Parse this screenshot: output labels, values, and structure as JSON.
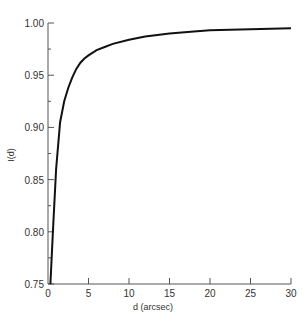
{
  "chart_data": {
    "type": "line",
    "title": "",
    "xlabel": "d (arcsec)",
    "ylabel": "I(d)",
    "xlim": [
      0,
      30
    ],
    "ylim": [
      0.75,
      1.0
    ],
    "grid": false,
    "legend": null,
    "x_ticks": [
      "0",
      "5",
      "10",
      "15",
      "20",
      "25",
      "30"
    ],
    "y_ticks": [
      "0.75",
      "0.80",
      "0.85",
      "0.90",
      "0.95",
      "1.00"
    ],
    "series": [
      {
        "name": "I(d)",
        "x": [
          0.3,
          0.6,
          1.0,
          1.5,
          2.0,
          2.5,
          3.0,
          3.5,
          4.0,
          4.5,
          5.0,
          6.0,
          7.0,
          8.0,
          10.0,
          12.0,
          15.0,
          18.0,
          20.0,
          25.0,
          30.0
        ],
        "values": [
          0.75,
          0.8,
          0.86,
          0.905,
          0.925,
          0.938,
          0.948,
          0.956,
          0.962,
          0.966,
          0.969,
          0.974,
          0.977,
          0.98,
          0.984,
          0.987,
          0.99,
          0.992,
          0.993,
          0.994,
          0.995
        ]
      }
    ],
    "line_color": "#111111"
  }
}
